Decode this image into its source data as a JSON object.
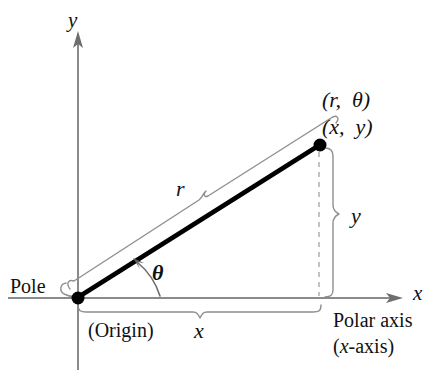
{
  "figure": {
    "background_color": "#ffffff",
    "axis_color": "#8a8a8a",
    "line_color": "#000000",
    "brace_color": "#777777",
    "dash_color": "#b0b0b0"
  },
  "labels": {
    "y_axis": "y",
    "x_axis": "x",
    "point_polar": "(r,  θ)",
    "point_rect": "(x,  y)",
    "radius": "r",
    "angle": "θ",
    "pole": "Pole",
    "origin": "(Origin)",
    "x_component": "x",
    "y_component": "y",
    "polar_axis": "Polar axis",
    "polar_axis_alt": "(x-axis)"
  },
  "geometry": {
    "origin": {
      "x": 78,
      "y": 298
    },
    "point": {
      "x": 320,
      "y": 145
    },
    "y_axis_top": {
      "x": 78,
      "y": 32
    },
    "y_axis_bottom": {
      "x": 78,
      "y": 370
    },
    "x_axis_left": {
      "x": 8,
      "y": 298
    },
    "x_axis_right": {
      "x": 402,
      "y": 298
    },
    "angle_arc_degrees": 32
  },
  "icons": {
    "origin_dot": "filled-circle",
    "point_dot": "filled-circle",
    "y_axis_arrow": "arrow-up",
    "x_axis_arrow": "arrow-right",
    "angle_arrow": "arc-arrow"
  }
}
